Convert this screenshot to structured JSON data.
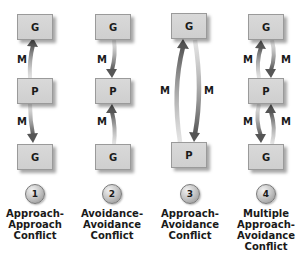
{
  "colors": {
    "box_fill": "#d4d4d4",
    "arrow": "#555555",
    "text": "#1a1a1a"
  },
  "columns": [
    {
      "number": "1",
      "caption_lines": [
        "Approach-",
        "Approach",
        "Conflict"
      ],
      "boxes": [
        "G",
        "P",
        "G"
      ],
      "motives": [
        "M",
        "M"
      ]
    },
    {
      "number": "2",
      "caption_lines": [
        "Avoidance-",
        "Avoidance",
        "Conflict"
      ],
      "boxes": [
        "G",
        "P",
        "G"
      ],
      "motives": [
        "M",
        "M"
      ]
    },
    {
      "number": "3",
      "caption_lines": [
        "Approach-",
        "Avoidance",
        "Conflict"
      ],
      "boxes": [
        "G",
        "P"
      ],
      "motives": [
        "M",
        "M"
      ]
    },
    {
      "number": "4",
      "caption_lines": [
        "Multiple",
        "Approach-",
        "Avoidance",
        "Conflict"
      ],
      "boxes": [
        "G",
        "P",
        "G"
      ],
      "motives": [
        "M",
        "M",
        "M",
        "M"
      ]
    }
  ]
}
